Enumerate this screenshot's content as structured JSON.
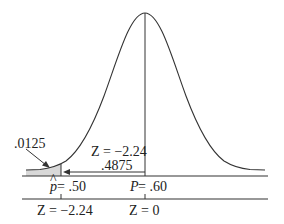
{
  "diagram": {
    "type": "normal-distribution",
    "left_tail_area": ".0125",
    "z_label": "Z = −2.24",
    "center_area": ".4875",
    "axis_p": {
      "left_label": "p̂ = .50",
      "left_hat_symbol": "p",
      "left_value": " = .50",
      "center_label": "P = .60",
      "center_symbol": "P",
      "center_value": " = .60"
    },
    "axis_z": {
      "left_label": "Z = −2.24",
      "center_label": "Z = 0"
    },
    "colors": {
      "line": "#333333",
      "shade": "#d8d8d8"
    }
  }
}
